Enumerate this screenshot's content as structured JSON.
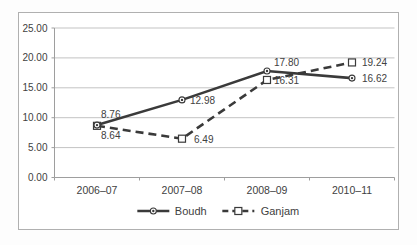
{
  "chart_data": {
    "type": "line",
    "title": "",
    "categories": [
      "2006–07",
      "2007–08",
      "2008–09",
      "2010–11"
    ],
    "series": [
      {
        "name": "Boudh",
        "values": [
          8.76,
          12.98,
          17.8,
          16.62
        ],
        "labels": [
          "8.76",
          "12.98",
          "17.80",
          "16.62"
        ],
        "line_style": "solid",
        "marker": "circle-dot",
        "label_offsets": [
          [
            4,
            -7
          ],
          [
            8,
            4
          ],
          [
            7,
            -5
          ],
          [
            10,
            4
          ]
        ]
      },
      {
        "name": "Ganjam",
        "values": [
          8.64,
          6.49,
          16.31,
          19.24
        ],
        "labels": [
          "8.64",
          "6.49",
          "16.31",
          "19.24"
        ],
        "line_style": "dashed",
        "marker": "square",
        "label_offsets": [
          [
            4,
            13
          ],
          [
            12,
            4
          ],
          [
            7,
            4
          ],
          [
            10,
            4
          ]
        ]
      }
    ],
    "xlabel": "",
    "ylabel": "",
    "ylim": [
      0,
      25
    ],
    "ytick_step": 5,
    "ytick_labels": [
      "0.00",
      "5.00",
      "10.00",
      "15.00",
      "20.00",
      "25.00"
    ],
    "grid": "horizontal",
    "legend_position": "bottom",
    "colors": {
      "line": "#3a3a3a",
      "text": "#414141",
      "grid": "#c3c3c3",
      "axis": "#9e9e9e",
      "marker_fill": "#ffffff",
      "plot_background": "#ffffff",
      "border": "#b0b0b0"
    }
  }
}
